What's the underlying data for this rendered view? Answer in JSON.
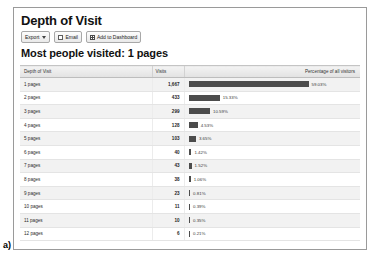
{
  "figure": {
    "label": "a)"
  },
  "report": {
    "title": "Depth of Visit",
    "subtitle": "Most people visited: 1 pages"
  },
  "toolbar": {
    "export_label": "Export",
    "email_label": "Email",
    "dashboard_label": "Add to Dashboard",
    "icons": {
      "export_caret": "chevron-down-icon",
      "email": "envelope-icon",
      "dashboard": "grid-icon"
    }
  },
  "table": {
    "columns": {
      "depth": "Depth of Visit",
      "visits": "Visits",
      "percentage": "Percentage of all visitors"
    },
    "rows": [
      {
        "depth": "1 pages",
        "visits": "1,667",
        "percent_label": "59.03%",
        "percent": 59.03
      },
      {
        "depth": "2 pages",
        "visits": "433",
        "percent_label": "15.33%",
        "percent": 15.33
      },
      {
        "depth": "3 pages",
        "visits": "299",
        "percent_label": "10.59%",
        "percent": 10.59
      },
      {
        "depth": "4 pages",
        "visits": "128",
        "percent_label": "4.53%",
        "percent": 4.53
      },
      {
        "depth": "5 pages",
        "visits": "103",
        "percent_label": "3.65%",
        "percent": 3.65
      },
      {
        "depth": "6 pages",
        "visits": "40",
        "percent_label": "1.42%",
        "percent": 1.42
      },
      {
        "depth": "7 pages",
        "visits": "43",
        "percent_label": "1.52%",
        "percent": 1.52
      },
      {
        "depth": "8 pages",
        "visits": "38",
        "percent_label": "1.06%",
        "percent": 1.06
      },
      {
        "depth": "9 pages",
        "visits": "23",
        "percent_label": "0.81%",
        "percent": 0.81
      },
      {
        "depth": "10 pages",
        "visits": "11",
        "percent_label": "0.39%",
        "percent": 0.39
      },
      {
        "depth": "11 pages",
        "visits": "10",
        "percent_label": "0.35%",
        "percent": 0.35
      },
      {
        "depth": "12 pages",
        "visits": "6",
        "percent_label": "0.21%",
        "percent": 0.21
      }
    ]
  },
  "colors": {
    "bar": "#4c4c4c",
    "panel_border": "#9a9a9a",
    "header_bg": "#eaeaea",
    "row_alt": "#f2f2f2"
  },
  "chart_data": {
    "type": "bar",
    "title": "Depth of Visit",
    "subtitle": "Most people visited: 1 pages",
    "orientation": "horizontal",
    "xlabel": "Percentage of all visitors",
    "ylabel": "Depth of Visit",
    "categories": [
      "1 pages",
      "2 pages",
      "3 pages",
      "4 pages",
      "5 pages",
      "6 pages",
      "7 pages",
      "8 pages",
      "9 pages",
      "10 pages",
      "11 pages",
      "12 pages"
    ],
    "series": [
      {
        "name": "Percentage of all visitors",
        "values": [
          59.03,
          15.33,
          10.59,
          4.53,
          3.65,
          1.42,
          1.52,
          1.06,
          0.81,
          0.39,
          0.35,
          0.21
        ]
      },
      {
        "name": "Visits",
        "values": [
          1667,
          433,
          299,
          128,
          103,
          40,
          43,
          38,
          23,
          11,
          10,
          6
        ]
      }
    ],
    "xlim": [
      0,
      59.03
    ],
    "grid": false,
    "legend": "none"
  }
}
